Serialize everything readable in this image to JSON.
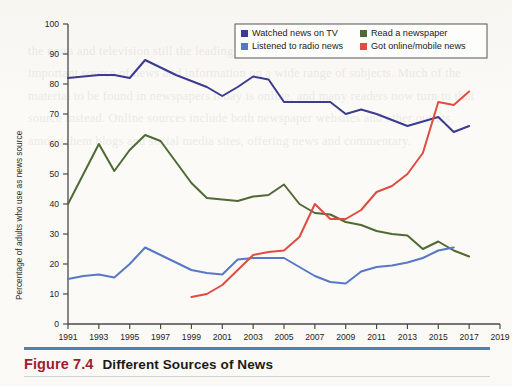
{
  "figure": {
    "number_label": "Figure 7.4",
    "title": "Different Sources of News",
    "accent_color": "#9e1b32",
    "rule_color": "#2f6ea5"
  },
  "page": {
    "background_color": "#fbfaf7",
    "bleed_through_text": "the news and television still the leading source for that purpose. Newspapers remain an important source of news and information on a wide range of subjects. Much of the material to be found in newspapers today is online, and many readers now turn to that source instead. Online sources include both newspaper websites and other outlets, among them blogs and social media sites, offering news and commentary."
  },
  "chart_data": {
    "type": "line",
    "title": "",
    "xlabel": "",
    "ylabel": "Percentage of adults who use as news source",
    "xlim": [
      1991,
      2019
    ],
    "ylim": [
      0,
      100
    ],
    "grid": false,
    "legend_position": "top-right",
    "xticks": [
      1991,
      1993,
      1995,
      1997,
      1999,
      2001,
      2003,
      2005,
      2007,
      2009,
      2011,
      2013,
      2015,
      2017,
      2019
    ],
    "yticks": [
      0,
      10,
      20,
      30,
      40,
      50,
      60,
      70,
      80,
      90,
      100
    ],
    "series": [
      {
        "name": "Watched news on TV",
        "color": "#3b3b8f",
        "x": [
          1991,
          1992,
          1993,
          1994,
          1995,
          1996,
          1997,
          1998,
          1999,
          2000,
          2001,
          2002,
          2003,
          2004,
          2005,
          2006,
          2007,
          2008,
          2009,
          2010,
          2011,
          2012,
          2013,
          2014,
          2015,
          2016,
          2017
        ],
        "values": [
          82,
          82.5,
          83,
          83,
          82,
          88,
          85.5,
          83,
          81,
          79,
          76,
          79,
          82.5,
          81.5,
          74,
          74,
          74,
          74,
          70,
          71.5,
          70,
          68,
          66,
          67.5,
          69,
          64,
          66
        ]
      },
      {
        "name": "Read a newspaper",
        "color": "#4f6a35",
        "x": [
          1991,
          1992,
          1993,
          1994,
          1995,
          1996,
          1997,
          1998,
          1999,
          2000,
          2001,
          2002,
          2003,
          2004,
          2005,
          2006,
          2007,
          2008,
          2009,
          2010,
          2011,
          2012,
          2013,
          2014,
          2015,
          2016,
          2017
        ],
        "values": [
          40,
          50,
          60,
          51,
          58,
          63,
          61,
          54,
          47,
          42,
          41.5,
          41,
          42.5,
          43,
          46.5,
          40,
          37,
          36.5,
          34,
          33,
          31,
          30,
          29.5,
          25,
          27.5,
          24.5,
          22.5
        ]
      },
      {
        "name": "Listened to radio news",
        "color": "#5778c4",
        "x": [
          1991,
          1992,
          1993,
          1994,
          1995,
          1996,
          1997,
          1998,
          1999,
          2000,
          2001,
          2002,
          2003,
          2004,
          2005,
          2006,
          2007,
          2008,
          2009,
          2010,
          2011,
          2012,
          2013,
          2014,
          2015,
          2016
        ],
        "values": [
          15,
          16,
          16.5,
          15.5,
          20,
          25.5,
          23,
          20.5,
          18,
          17,
          16.5,
          21.5,
          22,
          22,
          22,
          19,
          16,
          14,
          13.5,
          17.5,
          19,
          19.5,
          20.5,
          22,
          24.5,
          25.5
        ]
      },
      {
        "name": "Got online/mobile news",
        "color": "#e04b42",
        "x": [
          1999,
          2000,
          2001,
          2002,
          2003,
          2004,
          2005,
          2006,
          2007,
          2008,
          2009,
          2010,
          2011,
          2012,
          2013,
          2014,
          2015,
          2016,
          2017
        ],
        "values": [
          9,
          10,
          13,
          18,
          23,
          24,
          24.5,
          29,
          40,
          35,
          35,
          38,
          44,
          46,
          50,
          57,
          74,
          73,
          77.5
        ]
      }
    ]
  },
  "legend": {
    "entries": [
      {
        "label": "Watched news on TV",
        "color": "#3b3b8f"
      },
      {
        "label": "Read a newspaper",
        "color": "#4f6a35"
      },
      {
        "label": "Listened to radio news",
        "color": "#5778c4"
      },
      {
        "label": "Got online/mobile news",
        "color": "#e04b42"
      }
    ]
  }
}
